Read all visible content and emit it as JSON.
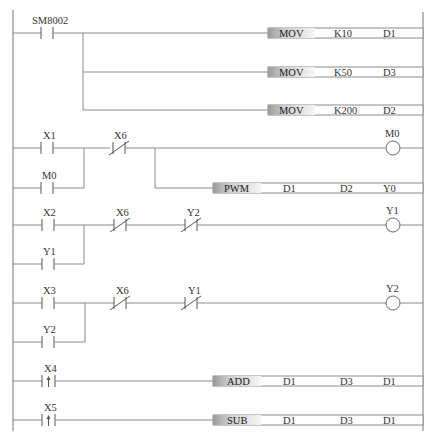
{
  "diagram": {
    "type": "PLC ladder diagram",
    "colors": {
      "wire": "#8a8a8a",
      "contact": "#555555",
      "text": "#333333",
      "op_gradient_dark": "#9a9a9a",
      "op_gradient_light": "#f2f2f2"
    },
    "rungs": [
      {
        "id": "rung-1",
        "contacts": [
          {
            "label": "SM8002",
            "type": "normally-open"
          }
        ],
        "instructions": [
          {
            "op": "MOV",
            "args": [
              "K10",
              "D1"
            ]
          },
          {
            "op": "MOV",
            "args": [
              "K50",
              "D3"
            ]
          },
          {
            "op": "MOV",
            "args": [
              "K200",
              "D2"
            ]
          }
        ]
      },
      {
        "id": "rung-2",
        "contacts": [
          {
            "label": "X1",
            "type": "normally-open"
          },
          {
            "label": "M0",
            "type": "normally-open",
            "parallel": true
          },
          {
            "label": "X6",
            "type": "normally-closed"
          }
        ],
        "coil": {
          "label": "M0"
        },
        "instructions": [
          {
            "op": "PWM",
            "args": [
              "D1",
              "D2",
              "Y0"
            ]
          }
        ]
      },
      {
        "id": "rung-3",
        "contacts": [
          {
            "label": "X2",
            "type": "normally-open"
          },
          {
            "label": "Y1",
            "type": "normally-open",
            "parallel": true
          },
          {
            "label": "X6",
            "type": "normally-closed"
          },
          {
            "label": "Y2",
            "type": "normally-closed"
          }
        ],
        "coil": {
          "label": "Y1"
        }
      },
      {
        "id": "rung-4",
        "contacts": [
          {
            "label": "X3",
            "type": "normally-open"
          },
          {
            "label": "Y2",
            "type": "normally-open",
            "parallel": true
          },
          {
            "label": "X6",
            "type": "normally-closed"
          },
          {
            "label": "Y1",
            "type": "normally-closed"
          }
        ],
        "coil": {
          "label": "Y2"
        }
      },
      {
        "id": "rung-5",
        "contacts": [
          {
            "label": "X4",
            "type": "rising-edge"
          }
        ],
        "instructions": [
          {
            "op": "ADD",
            "args": [
              "D1",
              "D3",
              "D1"
            ]
          }
        ]
      },
      {
        "id": "rung-6",
        "contacts": [
          {
            "label": "X5",
            "type": "rising-edge"
          }
        ],
        "instructions": [
          {
            "op": "SUB",
            "args": [
              "D1",
              "D3",
              "D1"
            ]
          }
        ]
      }
    ]
  }
}
